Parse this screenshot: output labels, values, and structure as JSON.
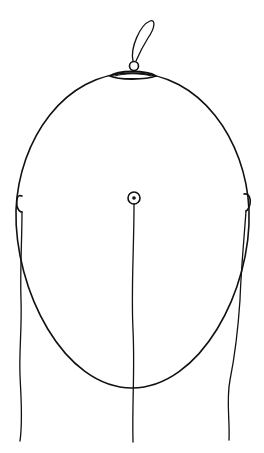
{
  "diagram": {
    "stroke_color": "#111111",
    "background": "#ffffff",
    "elements": [
      {
        "name": "head-outline",
        "shape": "ellipse"
      },
      {
        "name": "nose-marker",
        "shape": "flat-oval-at-top"
      },
      {
        "name": "ground-electrode-loop",
        "shape": "loop-above-nose"
      },
      {
        "name": "center-electrode",
        "shape": "ring-with-dot"
      },
      {
        "name": "left-ear-electrode",
        "shape": "small-clip"
      },
      {
        "name": "right-ear-electrode",
        "shape": "small-clip"
      },
      {
        "name": "left-lead-wire",
        "shape": "wavy-line"
      },
      {
        "name": "center-lead-wire",
        "shape": "wavy-line"
      },
      {
        "name": "right-lead-wire",
        "shape": "wavy-line"
      }
    ]
  }
}
